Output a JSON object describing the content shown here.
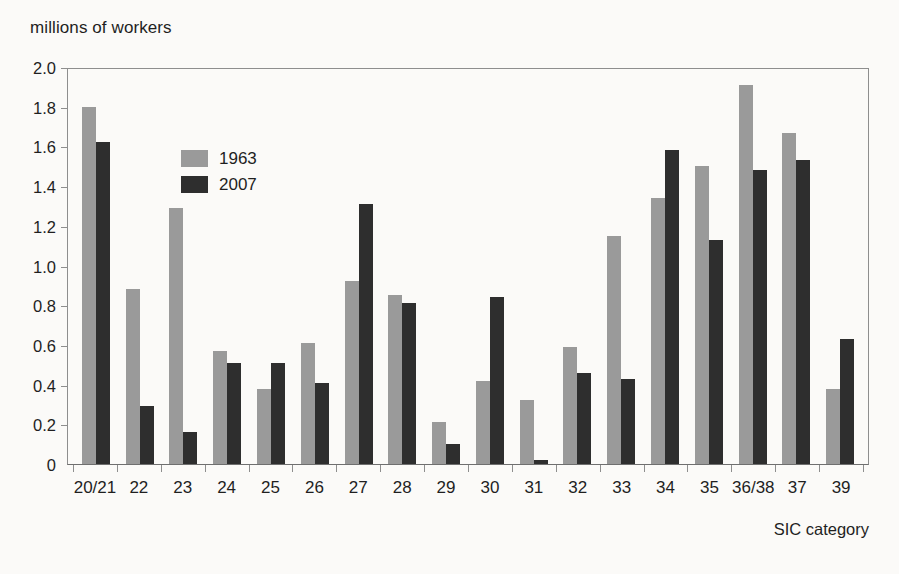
{
  "chart_data": {
    "type": "bar",
    "title": "millions of workers",
    "xlabel": "SIC category",
    "ylabel": "millions of workers",
    "ylim": [
      0,
      2.0
    ],
    "ytick_step": 0.2,
    "grid": false,
    "legend_position": "top-left inside plot",
    "categories": [
      "20/21",
      "22",
      "23",
      "24",
      "25",
      "26",
      "27",
      "28",
      "29",
      "30",
      "31",
      "32",
      "33",
      "34",
      "35",
      "36/38",
      "37",
      "39"
    ],
    "ytick_labels": [
      "2.0",
      "1.8",
      "1.6",
      "1.4",
      "1.2",
      "1.0",
      "0.8",
      "0.6",
      "0.4",
      "0.2",
      "0"
    ],
    "ytick_values": [
      2.0,
      1.8,
      1.6,
      1.4,
      1.2,
      1.0,
      0.8,
      0.6,
      0.4,
      0.2,
      0
    ],
    "series": [
      {
        "name": "1963",
        "color": "#9a9a9a",
        "values": [
          1.8,
          0.88,
          1.29,
          0.57,
          0.38,
          0.61,
          0.92,
          0.85,
          0.21,
          0.42,
          0.32,
          0.59,
          1.15,
          1.34,
          1.5,
          1.91,
          1.67,
          0.38
        ]
      },
      {
        "name": "2007",
        "color": "#2e2e2e",
        "values": [
          1.62,
          0.29,
          0.16,
          0.51,
          0.51,
          0.41,
          1.31,
          0.81,
          0.1,
          0.84,
          0.02,
          0.46,
          0.43,
          1.58,
          1.13,
          1.48,
          1.53,
          0.63
        ]
      }
    ]
  }
}
